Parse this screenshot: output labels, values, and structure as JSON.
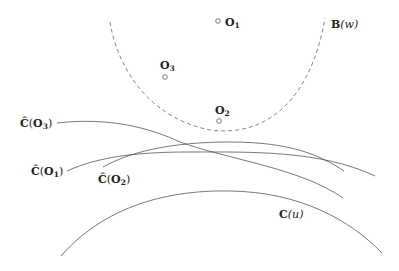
{
  "diagram": {
    "points": [
      {
        "id": "O1",
        "label": "O",
        "sub": "1",
        "x": 218,
        "y": 21
      },
      {
        "id": "O3",
        "label": "O",
        "sub": "3",
        "x": 165,
        "y": 77
      },
      {
        "id": "O2",
        "label": "O",
        "sub": "2",
        "x": 219,
        "y": 121
      }
    ],
    "ball": {
      "label": "B",
      "arg": "(w)",
      "style": "dashed"
    },
    "curves": [
      {
        "id": "C_hat_O3",
        "label": "Ĉ",
        "arg_open": "(",
        "arg": "O",
        "sub": "3",
        "arg_close": ")"
      },
      {
        "id": "C_hat_O1",
        "label": "Ĉ",
        "arg_open": "(",
        "arg": "O",
        "sub": "1",
        "arg_close": ")"
      },
      {
        "id": "C_hat_O2",
        "label": "Ĉ",
        "arg_open": "(",
        "arg": "O",
        "sub": "2",
        "arg_close": ")"
      },
      {
        "id": "C_u",
        "label": "C",
        "arg": "(u)"
      }
    ],
    "colors": {
      "stroke": "#555555",
      "text": "#222222",
      "background": "#ffffff"
    }
  }
}
